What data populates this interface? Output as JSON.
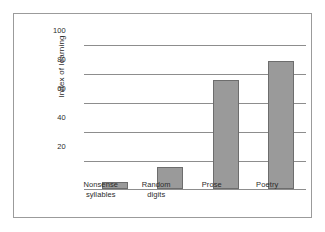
{
  "figure": {
    "background_color": "#ffffff",
    "frame_color": "#9b9b9b",
    "bar_fill_color": "#9a9a9a",
    "bar_border_color": "#6d6d6d",
    "gridline_color": "#8d8d8d",
    "text_color": "#2b2b2b"
  },
  "chart_data": {
    "type": "bar",
    "title": "",
    "xlabel": "",
    "ylabel": "Index of learning",
    "categories": [
      "Nonsense syllables",
      "Random digits",
      "Prose",
      "Poetry"
    ],
    "category_lines": [
      [
        "Nonsense",
        "syllables"
      ],
      [
        "Random",
        "digits"
      ],
      [
        "Prose",
        ""
      ],
      [
        "Poetry",
        ""
      ]
    ],
    "values": [
      5,
      15,
      75,
      88
    ],
    "ylim": [
      0,
      100
    ],
    "yticks": [
      20,
      40,
      60,
      80,
      100
    ],
    "ytick_labels": [
      "20",
      "40",
      "60",
      "80",
      "100"
    ],
    "grid": true,
    "legend": false,
    "legend_position": "none"
  }
}
